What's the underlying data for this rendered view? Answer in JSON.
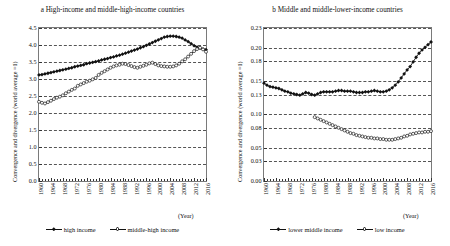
{
  "figure": {
    "axis_x_label": "(Year)"
  },
  "panels": [
    {
      "id": "a",
      "title": "a High-income and middle-high-income countries",
      "ylabel": "Convergence and divergence (world average =1)",
      "legend": [
        {
          "label": "high income",
          "marker": "filled-diamond"
        },
        {
          "label": "middle-high income",
          "marker": "open-circle"
        }
      ]
    },
    {
      "id": "b",
      "title": "b Middle and middle-lower-income countries",
      "ylabel": "Convergence and divergence (world average =1)",
      "legend": [
        {
          "label": "lower middle income",
          "marker": "filled-diamond"
        },
        {
          "label": "low income",
          "marker": "open-circle"
        }
      ]
    }
  ],
  "chart_data": [
    {
      "type": "line",
      "panel": "a",
      "title": "a High-income and middle-high-income countries",
      "xlabel": "(Year)",
      "ylabel": "Convergence and divergence (world average =1)",
      "grid": true,
      "legend_position": "bottom",
      "xlim": [
        1960,
        2016
      ],
      "ylim": [
        0.0,
        4.5
      ],
      "yticks": [
        0.0,
        0.5,
        1.0,
        1.5,
        2.0,
        2.5,
        3.0,
        3.5,
        4.0,
        4.5
      ],
      "ytick_labels": [
        "0.0",
        "0.5",
        "1.0",
        "1.5",
        "2.0",
        "2.5",
        "3.0",
        "3.5",
        "4.0",
        "4.5"
      ],
      "xticks": [
        1960,
        1964,
        1968,
        1972,
        1976,
        1980,
        1984,
        1988,
        1992,
        1996,
        2000,
        2004,
        2008,
        2012,
        2016
      ],
      "xtick_labels": [
        "1960",
        "1964",
        "1968",
        "1972",
        "1976",
        "1980",
        "1984",
        "1988",
        "1992",
        "1996",
        "2000",
        "2004",
        "2008",
        "2012",
        "2016"
      ],
      "x": [
        1960,
        1961,
        1962,
        1963,
        1964,
        1965,
        1966,
        1967,
        1968,
        1969,
        1970,
        1971,
        1972,
        1973,
        1974,
        1975,
        1976,
        1977,
        1978,
        1979,
        1980,
        1981,
        1982,
        1983,
        1984,
        1985,
        1986,
        1987,
        1988,
        1989,
        1990,
        1991,
        1992,
        1993,
        1994,
        1995,
        1996,
        1997,
        1998,
        1999,
        2000,
        2001,
        2002,
        2003,
        2004,
        2005,
        2006,
        2007,
        2008,
        2009,
        2010,
        2011,
        2012,
        2013,
        2014,
        2015,
        2016
      ],
      "series": [
        {
          "name": "high income",
          "marker": "filled-diamond",
          "values": [
            3.12,
            3.13,
            3.15,
            3.17,
            3.19,
            3.21,
            3.23,
            3.25,
            3.27,
            3.29,
            3.31,
            3.33,
            3.36,
            3.38,
            3.4,
            3.42,
            3.45,
            3.47,
            3.49,
            3.51,
            3.53,
            3.56,
            3.58,
            3.6,
            3.63,
            3.65,
            3.68,
            3.7,
            3.73,
            3.76,
            3.79,
            3.82,
            3.85,
            3.88,
            3.92,
            3.95,
            3.99,
            4.03,
            4.07,
            4.11,
            4.15,
            4.19,
            4.23,
            4.25,
            4.26,
            4.26,
            4.25,
            4.23,
            4.2,
            4.15,
            4.1,
            4.04,
            3.98,
            3.94,
            3.91,
            3.88,
            3.86
          ]
        },
        {
          "name": "middle-high income",
          "marker": "open-circle",
          "values": [
            2.33,
            2.3,
            2.28,
            2.32,
            2.36,
            2.41,
            2.45,
            2.48,
            2.52,
            2.58,
            2.63,
            2.68,
            2.72,
            2.8,
            2.84,
            2.88,
            2.92,
            2.95,
            2.99,
            3.03,
            3.12,
            3.18,
            3.23,
            3.28,
            3.33,
            3.37,
            3.4,
            3.42,
            3.45,
            3.44,
            3.41,
            3.38,
            3.35,
            3.33,
            3.36,
            3.39,
            3.42,
            3.46,
            3.48,
            3.44,
            3.4,
            3.38,
            3.37,
            3.36,
            3.36,
            3.37,
            3.4,
            3.45,
            3.52,
            3.58,
            3.66,
            3.74,
            3.82,
            3.88,
            3.92,
            3.87,
            3.8
          ]
        }
      ]
    },
    {
      "type": "line",
      "panel": "b",
      "title": "b Middle and middle-lower-income countries",
      "xlabel": "(Year)",
      "ylabel": "Convergence and divergence (world average =1)",
      "grid": true,
      "legend_position": "bottom",
      "xlim": [
        1960,
        2016
      ],
      "ylim": [
        0.0,
        0.23
      ],
      "yticks": [
        0.0,
        0.03,
        0.05,
        0.08,
        0.1,
        0.13,
        0.15,
        0.18,
        0.2,
        0.23
      ],
      "ytick_labels": [
        "0.00",
        "0.03",
        "0.05",
        "0.08",
        "0.10",
        "0.13",
        "0.15",
        "0.18",
        "0.20",
        "0.23"
      ],
      "xticks": [
        1960,
        1964,
        1968,
        1972,
        1976,
        1980,
        1984,
        1988,
        1992,
        1996,
        2000,
        2004,
        2008,
        2012,
        2016
      ],
      "xtick_labels": [
        "1960",
        "1964",
        "1968",
        "1972",
        "1976",
        "1980",
        "1984",
        "1988",
        "1992",
        "1996",
        "2000",
        "2004",
        "2008",
        "2012",
        "2016"
      ],
      "x": [
        1960,
        1961,
        1962,
        1963,
        1964,
        1965,
        1966,
        1967,
        1968,
        1969,
        1970,
        1971,
        1972,
        1973,
        1974,
        1975,
        1976,
        1977,
        1978,
        1979,
        1980,
        1981,
        1982,
        1983,
        1984,
        1985,
        1986,
        1987,
        1988,
        1989,
        1990,
        1991,
        1992,
        1993,
        1994,
        1995,
        1996,
        1997,
        1998,
        1999,
        2000,
        2001,
        2002,
        2003,
        2004,
        2005,
        2006,
        2007,
        2008,
        2009,
        2010,
        2011,
        2012,
        2013,
        2014,
        2015,
        2016
      ],
      "series": [
        {
          "name": "lower middle income",
          "marker": "filled-diamond",
          "values": [
            0.147,
            0.144,
            0.142,
            0.141,
            0.14,
            0.139,
            0.137,
            0.135,
            0.134,
            0.132,
            0.131,
            0.13,
            0.129,
            0.131,
            0.133,
            0.132,
            0.13,
            0.129,
            0.131,
            0.133,
            0.134,
            0.134,
            0.134,
            0.134,
            0.135,
            0.136,
            0.136,
            0.135,
            0.135,
            0.135,
            0.134,
            0.133,
            0.133,
            0.133,
            0.134,
            0.134,
            0.135,
            0.136,
            0.135,
            0.134,
            0.134,
            0.135,
            0.137,
            0.14,
            0.144,
            0.149,
            0.155,
            0.161,
            0.167,
            0.172,
            0.179,
            0.186,
            0.192,
            0.197,
            0.201,
            0.205,
            0.209
          ]
        },
        {
          "name": "low income",
          "marker": "open-circle",
          "values": [
            null,
            null,
            null,
            null,
            null,
            null,
            null,
            null,
            null,
            null,
            null,
            null,
            null,
            null,
            null,
            null,
            null,
            0.096,
            0.094,
            0.092,
            0.09,
            0.088,
            0.086,
            0.084,
            0.082,
            0.08,
            0.078,
            0.076,
            0.074,
            0.072,
            0.071,
            0.069,
            0.068,
            0.067,
            0.066,
            0.065,
            0.065,
            0.064,
            0.064,
            0.063,
            0.063,
            0.062,
            0.062,
            0.062,
            0.063,
            0.064,
            0.065,
            0.067,
            0.068,
            0.07,
            0.071,
            0.072,
            0.073,
            0.073,
            0.074,
            0.074,
            0.075
          ]
        }
      ]
    }
  ]
}
